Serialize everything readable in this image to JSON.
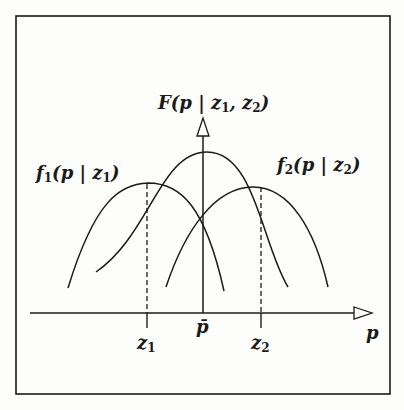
{
  "diagram": {
    "title": "",
    "combined_label": {
      "f": "F",
      "open": "(p | ",
      "z1": "z",
      "z1_sub": "1",
      "sep": ", ",
      "z2": "z",
      "z2_sub": "2",
      "close": ")"
    },
    "f1_label": {
      "f": "f",
      "sub": "1",
      "args": "(p | z",
      "argsub": "1",
      "close": ")"
    },
    "f2_label": {
      "f": "f",
      "sub": "2",
      "args": "(p | z",
      "argsub": "2",
      "close": ")"
    },
    "x_axis_label": "p",
    "ticks": [
      {
        "name": "z",
        "sub": "1"
      },
      {
        "name": "p̄",
        "sub": ""
      },
      {
        "name": "z",
        "sub": "2"
      }
    ],
    "colors": {
      "ink": "#1a1a1a",
      "background": "#fdfdfb"
    }
  }
}
